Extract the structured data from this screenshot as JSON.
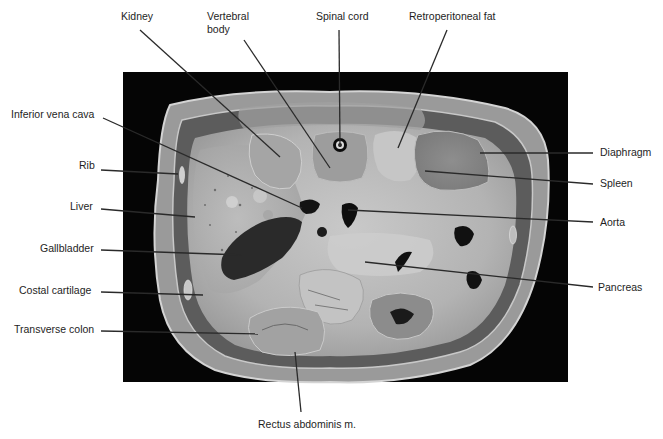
{
  "figure": {
    "type": "anatomical-cross-section",
    "background_color": "#000000",
    "specimen_tone": "#b9b9b9",
    "leader_line_color": "#2a2a2a"
  },
  "labels": {
    "top": [
      {
        "id": "kidney",
        "text": "Kidney"
      },
      {
        "id": "vertebral_body",
        "text": "Vertebral body",
        "line1": "Vertebral",
        "line2": "body"
      },
      {
        "id": "spinal_cord",
        "text": "Spinal cord"
      },
      {
        "id": "retroperitoneal_fat",
        "text": "Retroperitoneal fat"
      }
    ],
    "left": [
      {
        "id": "inferior_vena_cava",
        "text": "Inferior vena cava"
      },
      {
        "id": "rib",
        "text": "Rib"
      },
      {
        "id": "liver",
        "text": "Liver"
      },
      {
        "id": "gallbladder",
        "text": "Gallbladder"
      },
      {
        "id": "costal_cartilage",
        "text": "Costal cartilage"
      },
      {
        "id": "transverse_colon",
        "text": "Transverse colon"
      }
    ],
    "right": [
      {
        "id": "diaphragm",
        "text": "Diaphragm"
      },
      {
        "id": "spleen",
        "text": "Spleen"
      },
      {
        "id": "aorta",
        "text": "Aorta"
      },
      {
        "id": "pancreas",
        "text": "Pancreas"
      }
    ],
    "bottom": [
      {
        "id": "rectus_abdominis",
        "text": "Rectus abdominis m."
      }
    ]
  }
}
